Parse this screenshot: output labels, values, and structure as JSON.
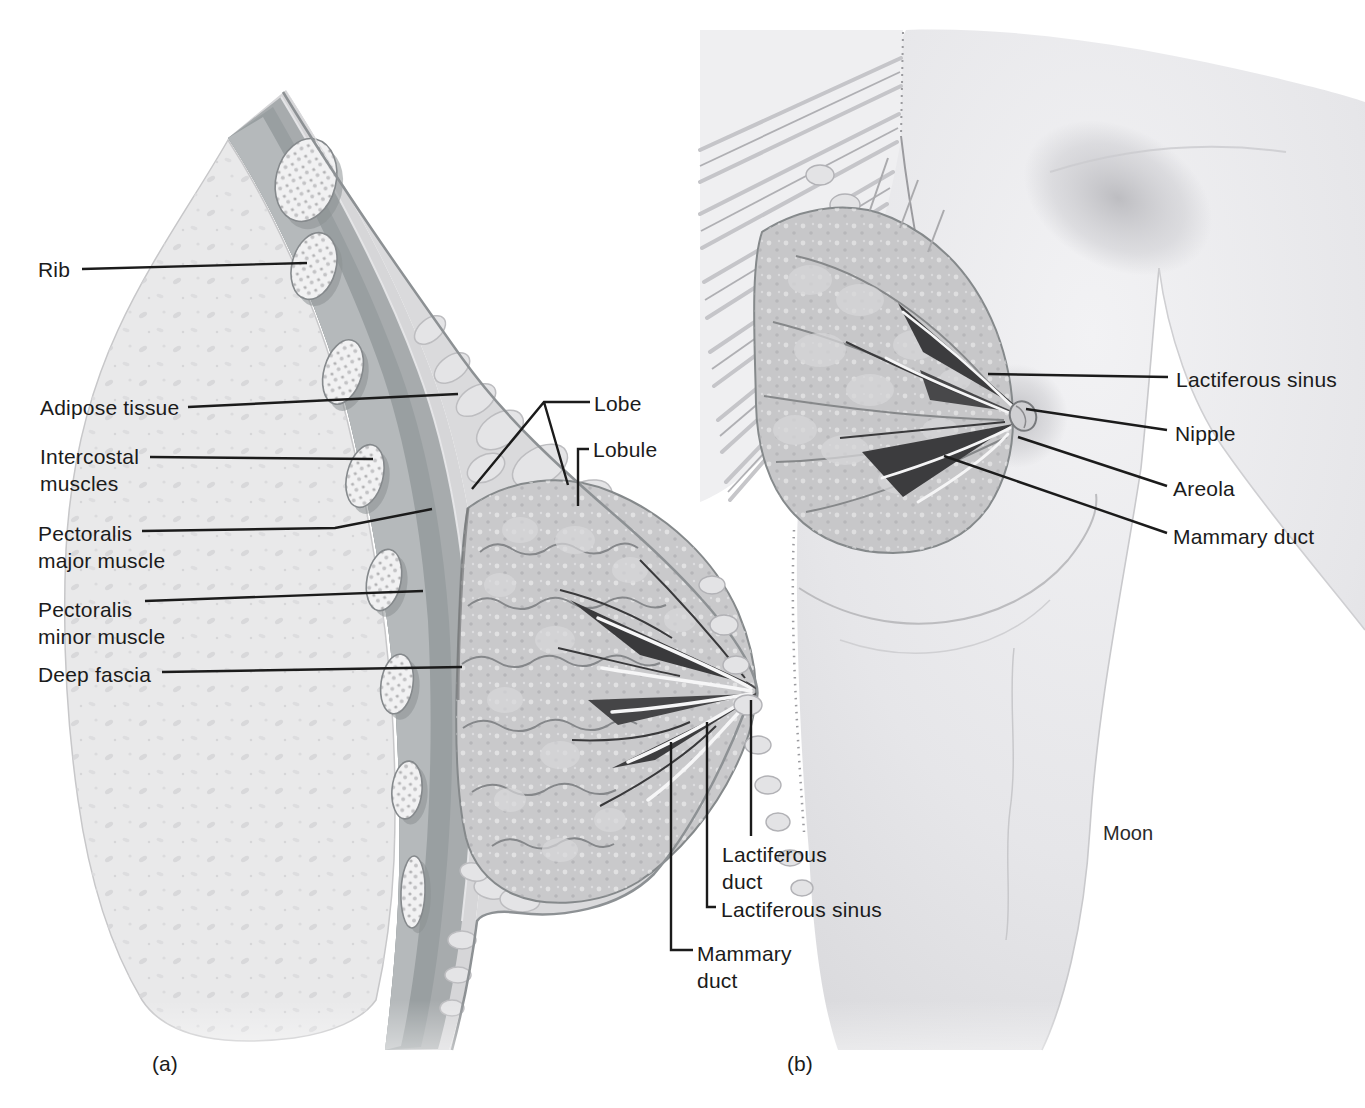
{
  "palette": {
    "ink": "#1b1b1b",
    "paper": "#ffffff"
  },
  "panel_a": {
    "caption": "(a)",
    "labels": {
      "rib": "Rib",
      "adipose_tissue": "Adipose tissue",
      "intercostal_muscles": "Intercostal\nmuscles",
      "pectoralis_major": "Pectoralis\nmajor muscle",
      "pectoralis_minor": "Pectoralis\nminor muscle",
      "deep_fascia": "Deep fascia",
      "lobe": "Lobe",
      "lobule": "Lobule",
      "lactiferous_duct": "Lactiferous\nduct",
      "lactiferous_sinus": "Lactiferous sinus",
      "mammary_duct": "Mammary\nduct"
    }
  },
  "panel_b": {
    "caption": "(b)",
    "labels": {
      "lactiferous_sinus": "Lactiferous sinus",
      "nipple": "Nipple",
      "areola": "Areola",
      "mammary_duct": "Mammary duct"
    },
    "artist_credit": "Moon"
  }
}
